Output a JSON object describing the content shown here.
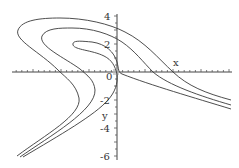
{
  "chart_data": {
    "type": "line",
    "title": "",
    "xlabel": "x",
    "ylabel": "y",
    "y_ticks": [
      "4",
      "2",
      "0",
      "-2",
      "-4",
      "-6"
    ],
    "x_ticks": [],
    "ylim": [
      -6,
      4.3
    ],
    "grid": false,
    "legend": null,
    "series": [
      {
        "name": "outer curve",
        "points_px": [
          [
            17,
            156
          ],
          [
            79,
            98
          ],
          [
            60,
            72
          ],
          [
            18,
            32
          ],
          [
            50,
            18
          ],
          [
            117,
            30
          ],
          [
            173,
            72
          ],
          [
            231,
            100
          ]
        ]
      },
      {
        "name": "middle curve",
        "points_px": [
          [
            20,
            157
          ],
          [
            95,
            90
          ],
          [
            82,
            72
          ],
          [
            42,
            37
          ],
          [
            70,
            28
          ],
          [
            117,
            44
          ],
          [
            153,
            72
          ],
          [
            231,
            105
          ]
        ]
      },
      {
        "name": "inner curve",
        "points_px": [
          [
            23,
            157
          ],
          [
            117,
            72
          ],
          [
            73,
            45
          ],
          [
            95,
            42
          ],
          [
            117,
            72
          ],
          [
            231,
            109
          ]
        ]
      }
    ],
    "origin_px": [
      117,
      72
    ],
    "y_unit_px": 14
  },
  "axes": {
    "x_label": "x",
    "y_label": "y",
    "y_tick_labels": [
      "4",
      "2",
      "0",
      "-2",
      "-4",
      "-6"
    ]
  }
}
